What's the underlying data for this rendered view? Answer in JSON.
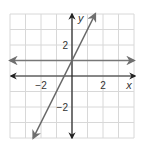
{
  "chart_data": {
    "type": "line",
    "title": "",
    "xlabel": "x",
    "ylabel": "y",
    "xlim": [
      -4,
      4
    ],
    "ylim": [
      -4,
      4
    ],
    "grid": true,
    "x_ticks": [
      {
        "value": -2,
        "label": "−2"
      },
      {
        "value": 2,
        "label": "2"
      }
    ],
    "y_ticks": [
      {
        "value": 2,
        "label": "2"
      },
      {
        "value": -2,
        "label": "−2"
      }
    ],
    "series": [
      {
        "name": "y = 1",
        "equation": "y = 1",
        "color": "#777777",
        "points": [
          [
            -4,
            1
          ],
          [
            4,
            1
          ]
        ],
        "arrows": "both"
      },
      {
        "name": "y = 2x + 1",
        "equation": "y = 2x + 1",
        "color": "#666666",
        "points": [
          [
            -2.5,
            -4
          ],
          [
            1.5,
            4
          ]
        ],
        "arrows": "both"
      }
    ],
    "intersection": [
      0,
      1
    ],
    "colors": {
      "grid": "#d8d8d8",
      "axes": "#222222"
    }
  }
}
